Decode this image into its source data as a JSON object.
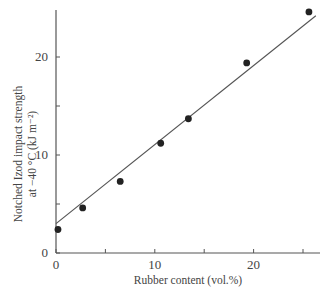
{
  "chart_data": {
    "type": "scatter",
    "title": "",
    "xlabel": "Rubber content (vol.%)",
    "ylabel_line1": "Notched Izod impact strength",
    "ylabel_line2": "at −40 °C (kJ m⁻²)",
    "xlim": [
      0,
      26.5
    ],
    "ylim": [
      0,
      25
    ],
    "x_ticks": [
      0,
      5,
      10,
      15,
      20,
      25
    ],
    "x_tick_labels": [
      "0",
      "",
      "10",
      "",
      "20",
      ""
    ],
    "y_ticks": [
      0,
      5,
      10,
      15,
      20
    ],
    "y_tick_labels": [
      "0",
      "",
      "10",
      "",
      "20"
    ],
    "grid": false,
    "legend": null,
    "series": [
      {
        "name": "measured",
        "marker": "filled-circle",
        "points": [
          {
            "x": 0.2,
            "y": 2.4
          },
          {
            "x": 2.7,
            "y": 4.6
          },
          {
            "x": 6.5,
            "y": 7.3
          },
          {
            "x": 10.6,
            "y": 11.2
          },
          {
            "x": 13.4,
            "y": 13.7
          },
          {
            "x": 19.3,
            "y": 19.4
          },
          {
            "x": 25.6,
            "y": 24.6
          }
        ]
      },
      {
        "name": "linear fit",
        "type": "line",
        "points": [
          {
            "x": 0,
            "y": 3.0
          },
          {
            "x": 26.3,
            "y": 24.2
          }
        ]
      }
    ],
    "colors": {
      "axis": "#555555",
      "marker": "#222222",
      "line": "#555555"
    }
  }
}
